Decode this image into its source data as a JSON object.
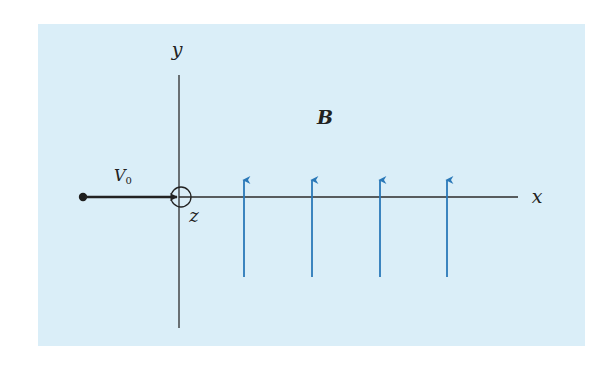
{
  "diagram": {
    "type": "physics-field-diagram",
    "background_color": "#daeef8",
    "axis_color": "#2b2b2b",
    "field_color": "#2a78b8",
    "labels": {
      "y_axis": "y",
      "x_axis": "x",
      "z_axis": "z",
      "field": "B",
      "velocity_main": "V",
      "velocity_sub": "0"
    },
    "particle": {
      "description": "particle moving along +x with initial velocity V0",
      "start": [
        83,
        197
      ],
      "arrow_end": [
        175,
        197
      ]
    },
    "origin_marker": {
      "description": "circle at origin indicating z-axis out of page",
      "center": [
        180,
        197
      ],
      "radius": 10
    },
    "field_arrows": {
      "direction": "+y",
      "count": 4,
      "x_positions": [
        244,
        312,
        380,
        447
      ],
      "y_bottom": 277,
      "y_top": 178
    }
  }
}
